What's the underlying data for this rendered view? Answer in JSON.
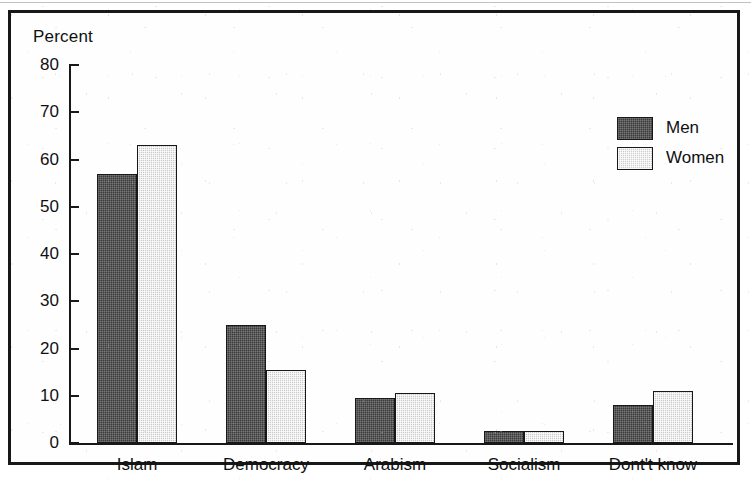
{
  "chart_data": {
    "type": "bar",
    "title": "",
    "ylabel": "Percent",
    "xlabel": "",
    "ylim": [
      0,
      80
    ],
    "yticks": [
      0,
      10,
      20,
      30,
      40,
      50,
      60,
      70,
      80
    ],
    "grid": false,
    "legend_position": "top-right",
    "categories": [
      "Islam",
      "Democracy",
      "Arabism",
      "Socialism",
      "Dont't know"
    ],
    "series": [
      {
        "name": "Men",
        "color": "#3b3b3b",
        "values": [
          57,
          25,
          9.5,
          2.5,
          8
        ]
      },
      {
        "name": "Women",
        "color": "#c9c9c9",
        "values": [
          63,
          15.5,
          10.5,
          2.5,
          11
        ]
      }
    ]
  },
  "legend": {
    "items": [
      {
        "label": "Men"
      },
      {
        "label": "Women"
      }
    ]
  }
}
